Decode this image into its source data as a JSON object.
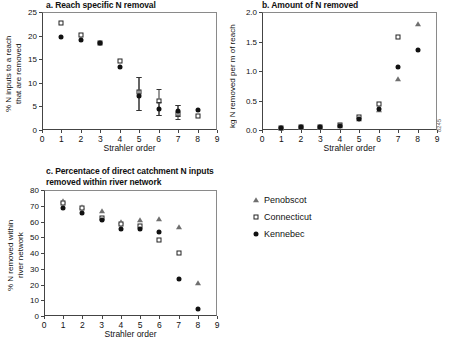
{
  "figure": {
    "axis_title": "Strahler order",
    "side_code": "8245"
  },
  "legend": {
    "items": [
      {
        "label": "Penobscot",
        "symbol": "triangle",
        "color": "#6f6f6f"
      },
      {
        "label": "Connecticut",
        "symbol": "open-square",
        "color": "#222222"
      },
      {
        "label": "Kennebec",
        "symbol": "filled-circle",
        "color": "#111111"
      }
    ]
  },
  "chart_data": [
    {
      "id": "panel-a",
      "type": "scatter",
      "title": "a. Reach specific N removal",
      "xlabel": "Strahler order",
      "ylabel": "% N inputs to a reach\nthat are removed",
      "xlim": [
        0,
        9
      ],
      "ylim": [
        0,
        25
      ],
      "xticks": [
        0,
        1,
        2,
        3,
        4,
        5,
        6,
        7,
        8,
        9
      ],
      "yticks": [
        0,
        5,
        10,
        15,
        20,
        25
      ],
      "grid": false,
      "x": [
        1,
        2,
        3,
        4,
        5,
        6,
        7,
        8
      ],
      "series": [
        {
          "name": "Connecticut",
          "symbol": "open-square",
          "values": [
            22.6,
            20.2,
            18.5,
            14.7,
            8.0,
            6.1,
            3.4,
            3.0
          ],
          "err_low": [
            null,
            null,
            null,
            null,
            4.3,
            3.2,
            2.4,
            null
          ],
          "err_high": [
            null,
            null,
            null,
            null,
            11.2,
            8.6,
            5.2,
            null
          ]
        },
        {
          "name": "Kennebec",
          "symbol": "filled-circle",
          "values": [
            19.8,
            19.1,
            18.4,
            13.3,
            7.1,
            4.4,
            4.1,
            4.3
          ],
          "err_low": [
            null,
            null,
            null,
            null,
            4.3,
            3.2,
            3.0,
            null
          ],
          "err_high": [
            null,
            null,
            null,
            null,
            11.2,
            6.0,
            5.2,
            null
          ]
        }
      ]
    },
    {
      "id": "panel-b",
      "type": "scatter",
      "title": "b. Amount of N removed",
      "xlabel": "Strahler order",
      "ylabel": "kg N removed per m of reach",
      "xlim": [
        0,
        9
      ],
      "ylim": [
        0.0,
        2.0
      ],
      "xticks": [
        0,
        1,
        2,
        3,
        4,
        5,
        6,
        7,
        8,
        9
      ],
      "yticks": [
        "0.0",
        "0.5",
        "1.0",
        "1.5",
        "2.0"
      ],
      "grid": false,
      "x": [
        1,
        2,
        3,
        4,
        5,
        6,
        7,
        8
      ],
      "series": [
        {
          "name": "Penobscot",
          "symbol": "triangle",
          "values": [
            0.04,
            0.05,
            0.05,
            0.06,
            0.19,
            0.34,
            0.86,
            1.8
          ]
        },
        {
          "name": "Connecticut",
          "symbol": "open-square",
          "values": [
            0.04,
            0.05,
            0.05,
            0.08,
            0.22,
            0.44,
            1.57,
            null
          ]
        },
        {
          "name": "Kennebec",
          "symbol": "filled-circle",
          "values": [
            0.04,
            0.05,
            0.05,
            0.06,
            0.18,
            0.36,
            1.06,
            1.36
          ]
        }
      ]
    },
    {
      "id": "panel-c",
      "type": "scatter",
      "title": "c. Percentace of direct catchment N inputs\nremoved within river network",
      "xlabel": "Strahler order",
      "ylabel": "% N removed within\nriver network",
      "xlim": [
        0,
        9
      ],
      "ylim": [
        0,
        80
      ],
      "xticks": [
        0,
        1,
        2,
        3,
        4,
        5,
        6,
        7,
        8,
        9
      ],
      "yticks": [
        0,
        10,
        20,
        30,
        40,
        50,
        60,
        70,
        80
      ],
      "grid": false,
      "x": [
        1,
        2,
        3,
        4,
        5,
        6,
        7,
        8
      ],
      "series": [
        {
          "name": "Penobscot",
          "symbol": "triangle",
          "values": [
            73.0,
            69.5,
            66.5,
            60.0,
            61.0,
            61.5,
            56.5,
            21.0
          ]
        },
        {
          "name": "Connecticut",
          "symbol": "open-square",
          "values": [
            71.5,
            68.5,
            62.5,
            58.5,
            57.0,
            48.0,
            40.0,
            null
          ]
        },
        {
          "name": "Kennebec",
          "symbol": "filled-circle",
          "values": [
            68.5,
            65.5,
            61.0,
            55.0,
            55.5,
            53.5,
            23.5,
            4.5
          ]
        }
      ]
    }
  ]
}
